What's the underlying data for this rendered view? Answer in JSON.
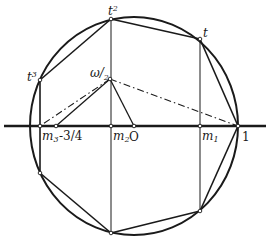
{
  "diagram": {
    "title": "",
    "colors": {
      "stroke": "#1a1a1a",
      "background": "#ffffff"
    },
    "circle": {
      "cx": 134,
      "cy": 126,
      "rx": 104,
      "ry": 109
    },
    "axis": {
      "x1": 4,
      "x2": 266,
      "y": 126
    },
    "labels": {
      "t": "t",
      "t2_base": "t",
      "t2_sup": "2",
      "t3_base": "t",
      "t3_sup": "3",
      "omega_base": "ω/",
      "omega_sub": "2",
      "m3_base": "m",
      "m3_sub": "3",
      "m2_base": "m",
      "m2_sub": "2",
      "m1_base": "m",
      "m1_sub": "1",
      "minus_three_quarters": "-3/4",
      "origin": "O",
      "one": "1"
    },
    "points": {
      "one": [
        238,
        126
      ],
      "t": [
        200,
        39
      ],
      "t2": [
        111,
        19
      ],
      "t3": [
        40,
        80
      ],
      "t3_conj": [
        40,
        173
      ],
      "t2_conj": [
        111,
        233
      ],
      "t_conj": [
        200,
        211
      ],
      "m3": [
        40,
        126
      ],
      "m2": [
        111,
        126
      ],
      "m1": [
        200,
        126
      ],
      "minus_three_quarters": [
        56,
        126
      ],
      "origin": [
        134,
        126
      ],
      "omega_half": [
        110,
        79
      ]
    }
  }
}
